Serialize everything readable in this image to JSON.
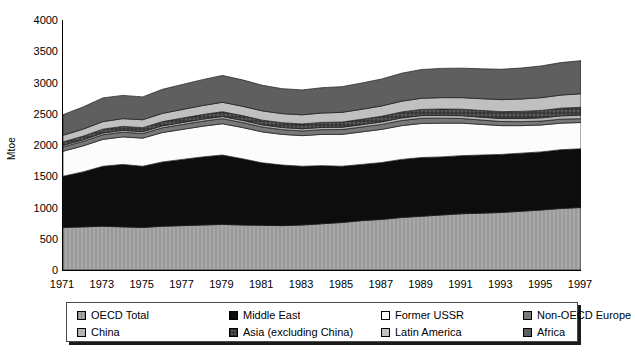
{
  "chart_data": {
    "type": "area",
    "stacked": true,
    "title": "",
    "subtitle": "",
    "xlabel": "",
    "ylabel": "Mtoe",
    "xlim": [
      1971,
      1997
    ],
    "ylim": [
      0,
      4000
    ],
    "yticks": [
      0,
      500,
      1000,
      1500,
      2000,
      2500,
      3000,
      3500,
      4000
    ],
    "xticks": [
      1971,
      1973,
      1975,
      1977,
      1979,
      1981,
      1983,
      1985,
      1987,
      1989,
      1991,
      1993,
      1995,
      1997
    ],
    "grid": false,
    "legend_position": "bottom",
    "x": [
      1971,
      1972,
      1973,
      1974,
      1975,
      1976,
      1977,
      1978,
      1979,
      1980,
      1981,
      1982,
      1983,
      1984,
      1985,
      1986,
      1987,
      1988,
      1989,
      1990,
      1991,
      1992,
      1993,
      1994,
      1995,
      1996,
      1997
    ],
    "series": [
      {
        "name": "OECD Total",
        "color": "#a8a8a8",
        "pattern": "vertical-hatch",
        "values": [
          680,
          690,
          700,
          690,
          680,
          700,
          710,
          720,
          730,
          720,
          715,
          710,
          720,
          740,
          760,
          790,
          810,
          840,
          860,
          880,
          900,
          910,
          920,
          940,
          960,
          985,
          1000
        ]
      },
      {
        "name": "Middle East",
        "color": "#0d0d0d",
        "pattern": "solid",
        "values": [
          820,
          880,
          960,
          1000,
          980,
          1030,
          1060,
          1090,
          1110,
          1060,
          1000,
          970,
          940,
          930,
          900,
          900,
          910,
          930,
          940,
          930,
          930,
          930,
          930,
          930,
          930,
          940,
          940
        ]
      },
      {
        "name": "Former USSR",
        "color": "#fcfcfc",
        "pattern": "solid",
        "values": [
          400,
          415,
          430,
          440,
          450,
          470,
          480,
          490,
          500,
          500,
          495,
          490,
          490,
          500,
          510,
          520,
          530,
          540,
          545,
          540,
          520,
          490,
          460,
          440,
          430,
          425,
          420
        ]
      },
      {
        "name": "Non-OECD Europe",
        "color": "#787878",
        "pattern": "solid",
        "values": [
          70,
          72,
          74,
          75,
          74,
          76,
          78,
          80,
          82,
          80,
          78,
          76,
          75,
          76,
          77,
          78,
          80,
          82,
          83,
          80,
          74,
          70,
          66,
          64,
          63,
          63,
          62
        ]
      },
      {
        "name": "China",
        "color": "#b4b4b4",
        "pattern": "solid",
        "values": [
          25,
          26,
          28,
          29,
          29,
          31,
          32,
          33,
          34,
          34,
          34,
          34,
          35,
          36,
          37,
          38,
          40,
          42,
          43,
          44,
          45,
          46,
          48,
          50,
          52,
          54,
          56
        ]
      },
      {
        "name": "Asia (excluding China)",
        "color": "#5a5a5a",
        "pattern": "cross-hatch",
        "values": [
          55,
          58,
          62,
          64,
          65,
          68,
          71,
          74,
          77,
          77,
          76,
          76,
          77,
          80,
          83,
          86,
          90,
          95,
          99,
          102,
          104,
          107,
          110,
          114,
          118,
          122,
          126
        ]
      },
      {
        "name": "Latin America",
        "color": "#c0c0c0",
        "pattern": "solid",
        "values": [
          105,
          112,
          120,
          124,
          126,
          132,
          138,
          144,
          150,
          150,
          148,
          146,
          146,
          150,
          155,
          160,
          165,
          172,
          178,
          182,
          185,
          188,
          192,
          198,
          204,
          210,
          216
        ]
      },
      {
        "name": "Africa",
        "color": "#5f5f5f",
        "pattern": "solid",
        "values": [
          330,
          355,
          380,
          372,
          366,
          385,
          400,
          415,
          430,
          422,
          410,
          400,
          398,
          405,
          412,
          420,
          432,
          448,
          460,
          468,
          472,
          478,
          486,
          496,
          508,
          520,
          530
        ]
      }
    ]
  },
  "legend": {
    "items": [
      {
        "label": "OECD Total",
        "swatch": "light-hatch-swatch"
      },
      {
        "label": "Middle East",
        "swatch": "black-swatch"
      },
      {
        "label": "Former USSR",
        "swatch": "white-swatch"
      },
      {
        "label": "Non-OECD Europe",
        "swatch": "mid-gray-swatch"
      },
      {
        "label": "China",
        "swatch": "light-gray-swatch"
      },
      {
        "label": "Asia (excluding China)",
        "swatch": "dark-hatch-swatch"
      },
      {
        "label": "Latin America",
        "swatch": "pale-gray-swatch"
      },
      {
        "label": "Africa",
        "swatch": "dark-gray-swatch"
      }
    ]
  }
}
